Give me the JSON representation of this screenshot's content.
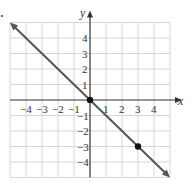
{
  "chart_data": {
    "type": "line",
    "title": "",
    "xlabel": "x",
    "ylabel": "y",
    "xlim": [
      -5,
      5
    ],
    "ylim": [
      -5,
      5
    ],
    "grid": true,
    "x_ticks": [
      "-4",
      "-3",
      "-2",
      "-1",
      "1",
      "2",
      "3",
      "4"
    ],
    "y_ticks": [
      "4",
      "3",
      "2",
      "1",
      "-1",
      "-2",
      "-3",
      "-4"
    ],
    "series": [
      {
        "name": "y = -x",
        "x": [
          -5,
          5
        ],
        "y": [
          5,
          -5
        ],
        "color": "#555555",
        "arrows": "both"
      }
    ],
    "points": [
      {
        "x": 0,
        "y": 0
      },
      {
        "x": 3,
        "y": -3
      }
    ]
  },
  "labels": {
    "x": "x",
    "y": "y"
  }
}
